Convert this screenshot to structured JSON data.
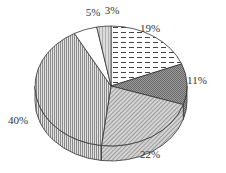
{
  "chart_data": {
    "type": "pie",
    "style": "3d-pie",
    "title": "",
    "categories": [
      "A",
      "B",
      "C",
      "D",
      "E",
      "F"
    ],
    "values": [
      19,
      11,
      22,
      40,
      5,
      3
    ],
    "labels": [
      "19%",
      "11%",
      "22%",
      "40%",
      "5%",
      "3%"
    ],
    "start_angle": "12 o'clock",
    "direction": "clockwise",
    "patterns": [
      "dashed-horizontal",
      "dense-crosshatch",
      "diagonal-hatch",
      "vertical-lines",
      "white",
      "light-vertical"
    ],
    "legend": "none"
  },
  "geometry": {
    "cx": 111,
    "cy": 86,
    "rx": 76,
    "ry": 60,
    "depth": 15
  }
}
